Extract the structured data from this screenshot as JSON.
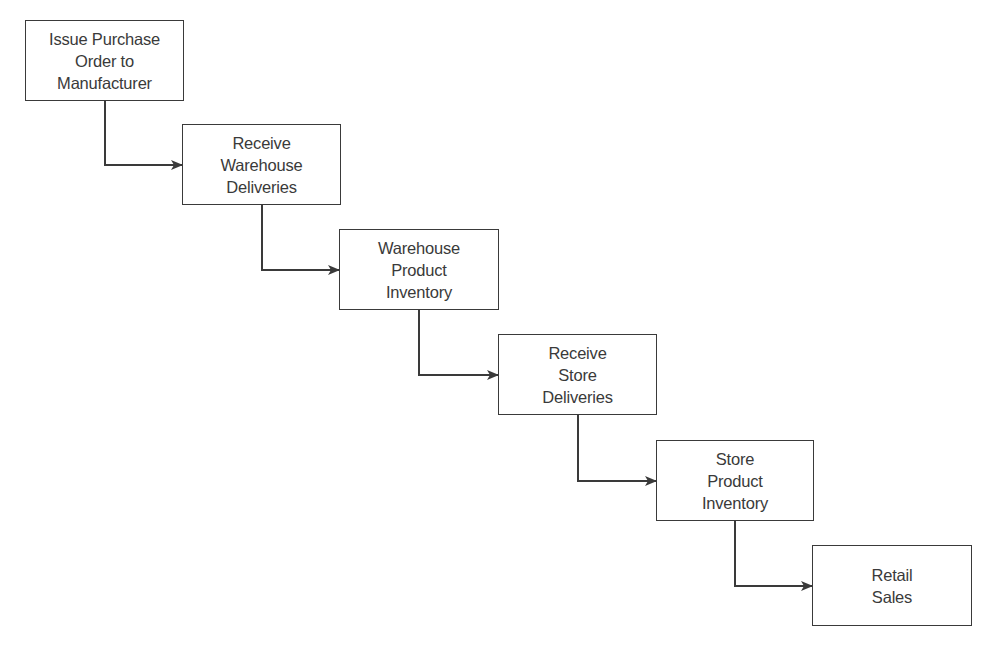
{
  "diagram": {
    "type": "flowchart",
    "title": "",
    "stroke_color": "#3a3a3a",
    "background": "#ffffff",
    "nodes": [
      {
        "id": "issue-po",
        "label": "Issue Purchase\nOrder to\nManufacturer",
        "x": 25,
        "y": 20,
        "w": 159,
        "h": 81
      },
      {
        "id": "receive-warehouse",
        "label": "Receive\nWarehouse\nDeliveries",
        "x": 182,
        "y": 124,
        "w": 159,
        "h": 81
      },
      {
        "id": "warehouse-inventory",
        "label": "Warehouse\nProduct\nInventory",
        "x": 339,
        "y": 229,
        "w": 160,
        "h": 81
      },
      {
        "id": "receive-store",
        "label": "Receive\nStore\nDeliveries",
        "x": 498,
        "y": 334,
        "w": 159,
        "h": 81
      },
      {
        "id": "store-inventory",
        "label": "Store\nProduct\nInventory",
        "x": 656,
        "y": 440,
        "w": 158,
        "h": 81
      },
      {
        "id": "retail-sales",
        "label": "Retail\nSales",
        "x": 812,
        "y": 545,
        "w": 160,
        "h": 81
      }
    ],
    "edges": [
      {
        "from": "issue-po",
        "to": "receive-warehouse"
      },
      {
        "from": "receive-warehouse",
        "to": "warehouse-inventory"
      },
      {
        "from": "warehouse-inventory",
        "to": "receive-store"
      },
      {
        "from": "receive-store",
        "to": "store-inventory"
      },
      {
        "from": "store-inventory",
        "to": "retail-sales"
      }
    ]
  }
}
